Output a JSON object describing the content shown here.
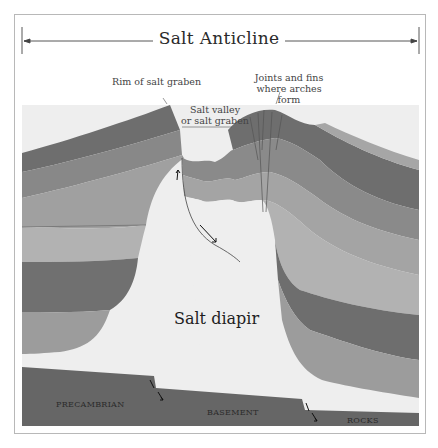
{
  "title": "Salt Anticline",
  "labels": {
    "rim": "Rim of salt graben",
    "valley_line1": "Salt valley",
    "valley_line2": "or salt graben",
    "joints_line1": "Joints and fins",
    "joints_line2": "where arches form",
    "diapir": "Salt diapir"
  },
  "basement": {
    "left": "PRECAMBRIAN",
    "middle": "BASEMENT",
    "right": "ROCKS"
  },
  "colors": {
    "layer_dark": "#6e6e6e",
    "layer_mid": "#8a8a8a",
    "layer_light": "#a6a6a6",
    "layer_lighter": "#b8b8b8",
    "salt": "#eeeeee",
    "basement": "#666666",
    "frame": "#b8b8b8"
  }
}
